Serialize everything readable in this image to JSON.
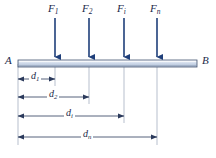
{
  "figure": {
    "colors": {
      "arrow": "#1f3f7a",
      "beam_border": "#3a4a6b",
      "beam_fill_light": "#eef2f8",
      "beam_fill_mid": "#c3cfe2",
      "dimension_line": "#2b3a5c",
      "extension_line": "#8d99ae",
      "text": "#1b2a4a",
      "background": "#ffffff"
    },
    "beam": {
      "left_support_label": "A",
      "right_support_label": "B",
      "x_start": 18,
      "x_end": 197,
      "y_top": 60,
      "thickness": 7
    },
    "forces": [
      {
        "label": "F",
        "subscript": "1",
        "x": 55,
        "arrow_top": 18,
        "arrow_bottom": 58,
        "label_x": 48,
        "label_y": 4
      },
      {
        "label": "F",
        "subscript": "2",
        "x": 89,
        "arrow_top": 18,
        "arrow_bottom": 58,
        "label_x": 82,
        "label_y": 4
      },
      {
        "label": "F",
        "subscript": "i",
        "x": 124,
        "arrow_top": 18,
        "arrow_bottom": 58,
        "label_x": 118,
        "label_y": 4
      },
      {
        "label": "F",
        "subscript": "n",
        "x": 157,
        "arrow_top": 18,
        "arrow_bottom": 58,
        "label_x": 150,
        "label_y": 4
      }
    ],
    "dimensions": [
      {
        "label": "d",
        "subscript": "1",
        "x_from": 18,
        "x_to": 55,
        "y": 79,
        "label_x": 30,
        "label_y": 72,
        "arrows": "both"
      },
      {
        "label": "d",
        "subscript": "2",
        "x_from": 18,
        "x_to": 89,
        "y": 97,
        "label_x": 47,
        "label_y": 90,
        "arrows": "both"
      },
      {
        "label": "d",
        "subscript": "i",
        "x_from": 18,
        "x_to": 124,
        "y": 116,
        "label_x": 64,
        "label_y": 109,
        "arrows": "both"
      },
      {
        "label": "d",
        "subscript": "n",
        "x_from": 18,
        "x_to": 157,
        "y": 137,
        "label_x": 81,
        "label_y": 130,
        "arrows": "both"
      }
    ],
    "extension_lines": [
      {
        "x": 18,
        "y_from": 64,
        "y_to": 145
      },
      {
        "x": 55,
        "y_from": 64,
        "y_to": 86
      },
      {
        "x": 89,
        "y_from": 64,
        "y_to": 104
      },
      {
        "x": 124,
        "y_from": 64,
        "y_to": 123
      },
      {
        "x": 157,
        "y_from": 64,
        "y_to": 145
      }
    ]
  }
}
